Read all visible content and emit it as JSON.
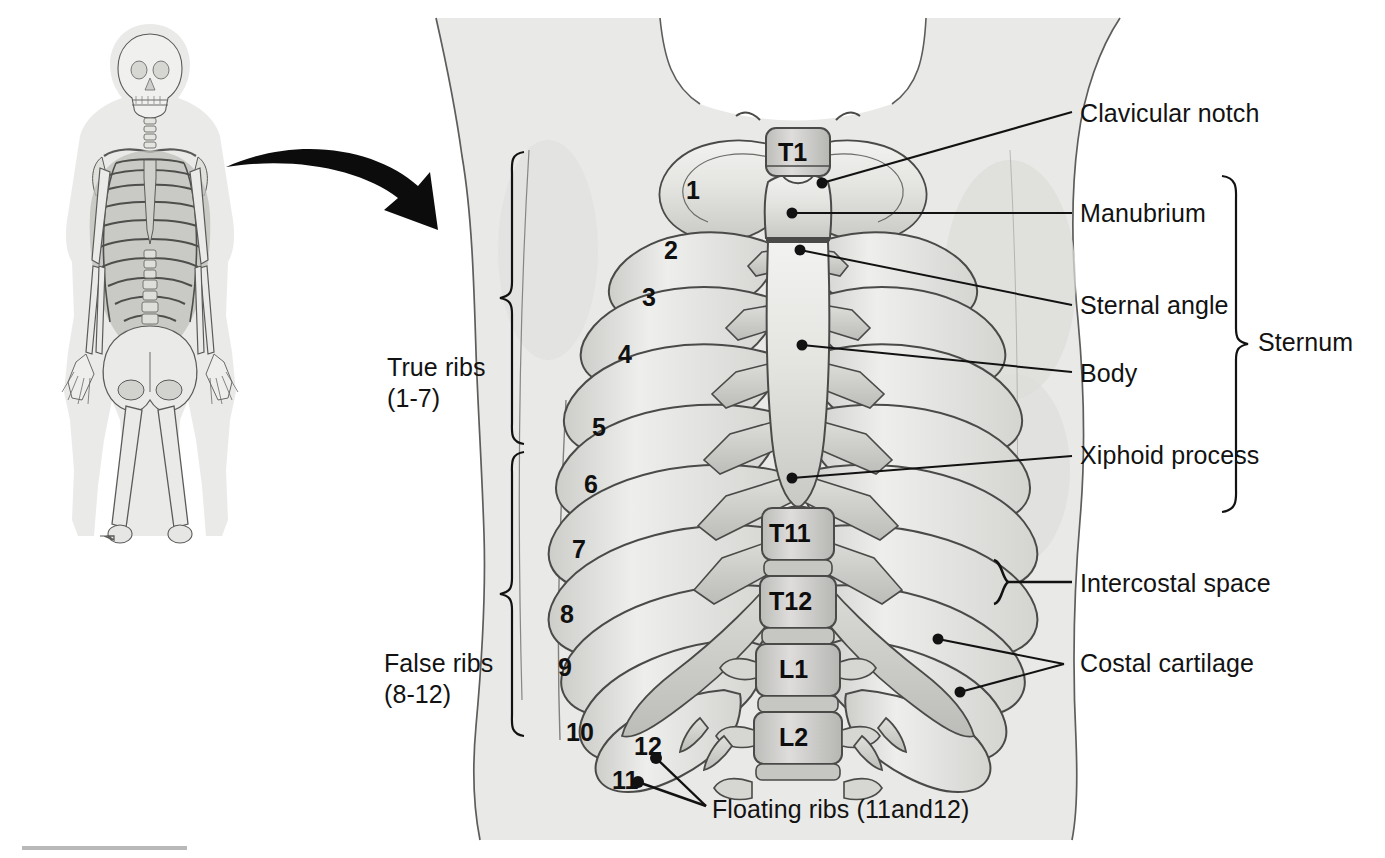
{
  "figure": {
    "overview_label": "whole-skeleton-overview",
    "colors": {
      "ink": "#121212",
      "bone_light": "#ececea",
      "bone_mid": "#d2d2cf",
      "bone_dark": "#b4b4b1",
      "cartilage": "#dcdcd9",
      "body_silhouette": "#e9e9e7",
      "shadow": "#cfcfcc",
      "arrow": "#0c0c0c"
    }
  },
  "callouts": {
    "right": [
      {
        "id": "clavicular-notch",
        "text": "Clavicular notch"
      },
      {
        "id": "manubrium",
        "text": "Manubrium"
      },
      {
        "id": "sternal-angle",
        "text": "Sternal angle"
      },
      {
        "id": "body",
        "text": "Body"
      },
      {
        "id": "xiphoid-process",
        "text": "Xiphoid process"
      },
      {
        "id": "intercostal-space",
        "text": "Intercostal space"
      },
      {
        "id": "costal-cartilage",
        "text": "Costal cartilage"
      }
    ],
    "bracket_right": {
      "id": "sternum",
      "text": "Sternum"
    },
    "left": [
      {
        "id": "true-ribs",
        "line1": "True ribs",
        "line2": "(1-7)"
      },
      {
        "id": "false-ribs",
        "line1": "False ribs",
        "line2": "(8-12)"
      }
    ],
    "bottom": {
      "id": "floating-ribs",
      "text": "Floating ribs (11and12)"
    }
  },
  "rib_numbers": [
    "1",
    "2",
    "3",
    "4",
    "5",
    "6",
    "7",
    "8",
    "9",
    "10",
    "11",
    "12"
  ],
  "vertebra_labels": [
    "T1",
    "T11",
    "T12",
    "L1",
    "L2"
  ]
}
